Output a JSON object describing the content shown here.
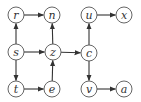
{
  "diagram": {
    "type": "directed-graph",
    "node_radius": 8,
    "nodes": [
      {
        "id": "r",
        "label": "r",
        "x": 16,
        "y": 15
      },
      {
        "id": "n",
        "label": "n",
        "x": 52,
        "y": 15
      },
      {
        "id": "u",
        "label": "u",
        "x": 89,
        "y": 15
      },
      {
        "id": "x",
        "label": "x",
        "x": 124,
        "y": 15
      },
      {
        "id": "s",
        "label": "s",
        "x": 16,
        "y": 52
      },
      {
        "id": "z",
        "label": "z",
        "x": 53,
        "y": 52
      },
      {
        "id": "c",
        "label": "c",
        "x": 89,
        "y": 53
      },
      {
        "id": "t",
        "label": "t",
        "x": 16,
        "y": 89
      },
      {
        "id": "e",
        "label": "e",
        "x": 52,
        "y": 89
      },
      {
        "id": "v",
        "label": "v",
        "x": 89,
        "y": 89
      },
      {
        "id": "a",
        "label": "a",
        "x": 124,
        "y": 89
      }
    ],
    "edges": [
      {
        "from": "r",
        "to": "n"
      },
      {
        "from": "u",
        "to": "x"
      },
      {
        "from": "s",
        "to": "r"
      },
      {
        "from": "s",
        "to": "z"
      },
      {
        "from": "s",
        "to": "t"
      },
      {
        "from": "z",
        "to": "n"
      },
      {
        "from": "z",
        "to": "c"
      },
      {
        "from": "c",
        "to": "u"
      },
      {
        "from": "c",
        "to": "v"
      },
      {
        "from": "t",
        "to": "e"
      },
      {
        "from": "e",
        "to": "z"
      },
      {
        "from": "v",
        "to": "a"
      }
    ],
    "colors": {
      "stroke": "#333333",
      "fill": "#ffffff"
    }
  }
}
